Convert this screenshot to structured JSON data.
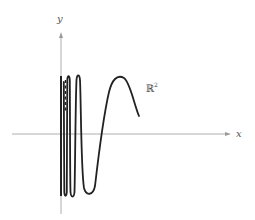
{
  "figure": {
    "colors": {
      "axis": "#9a9a9a",
      "curve": "#222222",
      "background": "#ffffff"
    },
    "axes": {
      "x_label": "x",
      "y_label": "y"
    },
    "space_label": {
      "base": "ℝ",
      "superscript": "2"
    }
  }
}
